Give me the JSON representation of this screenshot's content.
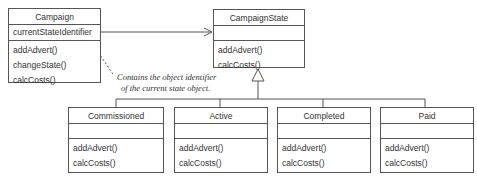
{
  "classes": {
    "campaign": {
      "name": "Campaign",
      "attributes": [
        "currentStateIdentifier"
      ],
      "operations": [
        "addAdvert()",
        "changeState()",
        "calcCosts()"
      ]
    },
    "campaign_state": {
      "name": "CampaignState",
      "attributes": [],
      "operations": [
        "addAdvert()",
        "calcCosts()"
      ]
    },
    "commissioned": {
      "name": "Commissioned",
      "attributes": [],
      "operations": [
        "addAdvert()",
        "calcCosts()"
      ]
    },
    "active": {
      "name": "Active",
      "attributes": [],
      "operations": [
        "addAdvert()",
        "calcCosts()"
      ]
    },
    "completed": {
      "name": "Completed",
      "attributes": [],
      "operations": [
        "addAdvert()",
        "calcCosts()"
      ]
    },
    "paid": {
      "name": "Paid",
      "attributes": [],
      "operations": [
        "addAdvert()",
        "calcCosts()"
      ]
    }
  },
  "note": {
    "line1": "Contains the object identifier",
    "line2": "of the current state object."
  },
  "colors": {
    "line": "#555555",
    "text": "#333333"
  }
}
